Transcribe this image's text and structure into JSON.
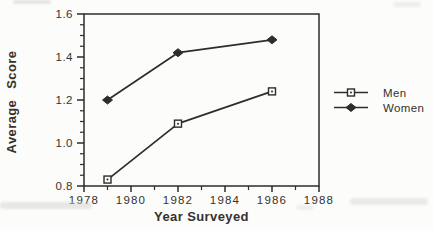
{
  "chart_data": {
    "type": "line",
    "title": "",
    "xlabel": "Year Surveyed",
    "ylabel": "Average Score",
    "x": [
      1979,
      1982,
      1986
    ],
    "series": [
      {
        "name": "Men",
        "marker": "open-square",
        "values": [
          0.83,
          1.09,
          1.24
        ]
      },
      {
        "name": "Women",
        "marker": "filled-diamond",
        "values": [
          1.2,
          1.42,
          1.48
        ]
      }
    ],
    "xlim": [
      1978,
      1988
    ],
    "ylim": [
      0.8,
      1.6
    ],
    "x_major_ticks": [
      1978,
      1980,
      1982,
      1984,
      1986,
      1988
    ],
    "x_minor_ticks": [
      1979,
      1981,
      1983,
      1985,
      1987
    ],
    "y_major_ticks": [
      0.8,
      1.0,
      1.2,
      1.4,
      1.6
    ],
    "y_minor_step": 0.05,
    "grid": false,
    "legend_position": "right",
    "colors": {
      "ink": "#2f2d2b",
      "paper": "#fcfcfa"
    }
  }
}
